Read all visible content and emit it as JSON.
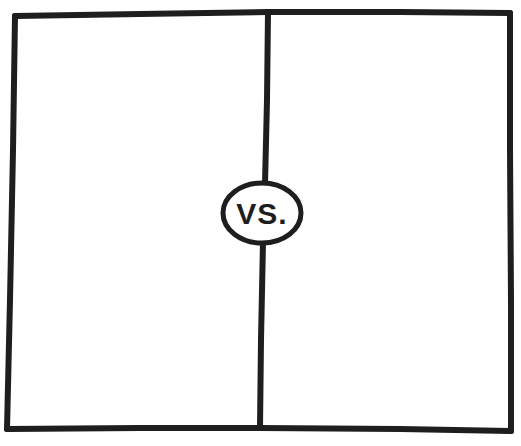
{
  "diagram": {
    "type": "comparison-template",
    "center_label": "VS.",
    "panels": [
      {
        "id": "left",
        "content": ""
      },
      {
        "id": "right",
        "content": ""
      }
    ],
    "colors": {
      "ink": "#1e1e1e",
      "paper": "#ffffff"
    }
  }
}
